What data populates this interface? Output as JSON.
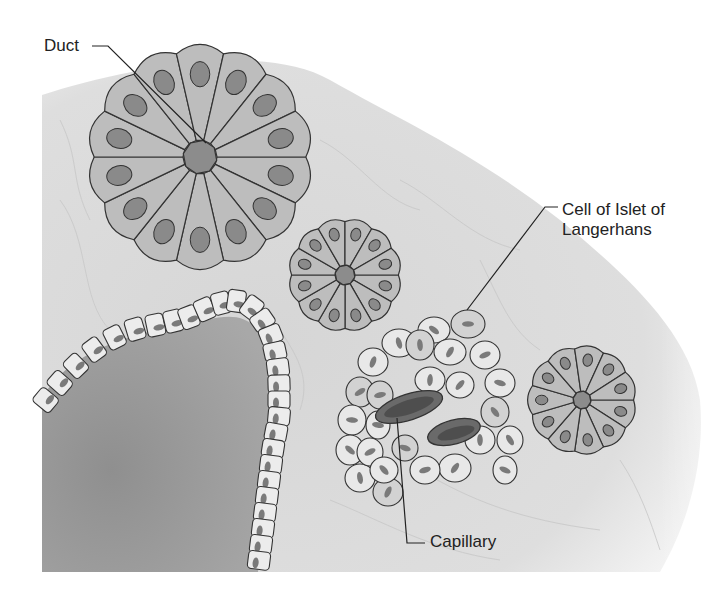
{
  "diagram": {
    "labels": {
      "duct": "Duct",
      "islet_line1": "Cell of Islet of",
      "islet_line2": "Langerhans",
      "capillary": "Capillary"
    },
    "colors": {
      "background": "#ffffff",
      "connective_tissue": "#dcdcdc",
      "acinar_cell": "#bdbdbd",
      "acinar_nucleus": "#8a8a8a",
      "duct_center": "#8c8c8c",
      "islet_cell": "#e8e8e8",
      "islet_nucleus": "#7a7a7a",
      "capillary": "#555555",
      "lumen": "#9a9a9a",
      "outline": "#333333",
      "text": "#222222"
    },
    "acini": [
      {
        "name": "large-acinus",
        "cx": 200,
        "cy": 157,
        "r": 115,
        "cells": 14,
        "duct_r": 17
      },
      {
        "name": "medium-acinus",
        "cx": 345,
        "cy": 275,
        "r": 58,
        "cells": 12,
        "duct_r": 10
      },
      {
        "name": "small-acinus",
        "cx": 582,
        "cy": 400,
        "r": 56,
        "cells": 11,
        "duct_r": 9
      }
    ]
  }
}
